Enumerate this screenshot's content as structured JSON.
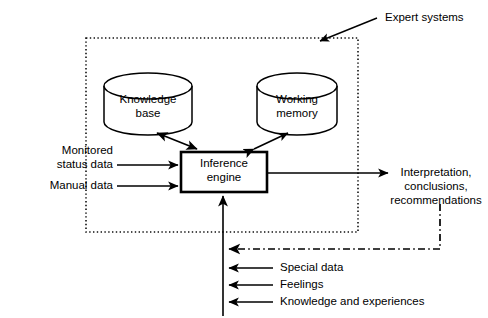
{
  "diagram": {
    "title_annotation": "Expert systems",
    "boundary": {
      "name": "expert-system-boundary",
      "style": "dotted",
      "x": 86,
      "y": 38,
      "width": 272,
      "height": 194
    },
    "nodes": [
      {
        "id": "knowledge-base",
        "shape": "cylinder",
        "label_line1": "Knowledge",
        "label_line2": "base",
        "x": 104,
        "y": 74,
        "width": 88,
        "height": 60
      },
      {
        "id": "working-memory",
        "shape": "cylinder",
        "label_line1": "Working",
        "label_line2": "memory",
        "x": 257,
        "y": 74,
        "width": 80,
        "height": 60
      },
      {
        "id": "inference-engine",
        "shape": "rectangle",
        "label_line1": "Inference",
        "label_line2": "engine",
        "x": 181,
        "y": 152,
        "width": 86,
        "height": 40
      }
    ],
    "inputs_left": [
      {
        "id": "monitored-status-data",
        "line1": "Monitored",
        "line2": "status data",
        "arrow_y": 165
      },
      {
        "id": "manual-data",
        "line1": "Manual data",
        "line2": "",
        "arrow_y": 186
      }
    ],
    "output_right": {
      "id": "interpretation-output",
      "line1": "Interpretation,",
      "line2": "conclusions,",
      "line3": "recommendations",
      "arrow_y": 173
    },
    "bottom_inputs": [
      {
        "id": "special-data",
        "label": "Special data",
        "arrow_y": 268
      },
      {
        "id": "feelings",
        "label": "Feelings",
        "arrow_y": 285
      },
      {
        "id": "knowledge-and-experiences",
        "label": "Knowledge and experiences",
        "arrow_y": 302
      }
    ],
    "feedback": {
      "id": "feedback-path",
      "style": "dash-dot",
      "from_x": 440,
      "from_y": 205,
      "corner_y": 249,
      "to_x": 225
    },
    "colors": {
      "stroke": "#000000",
      "background": "#ffffff",
      "boundary_stroke": "#1a1a1a"
    }
  }
}
